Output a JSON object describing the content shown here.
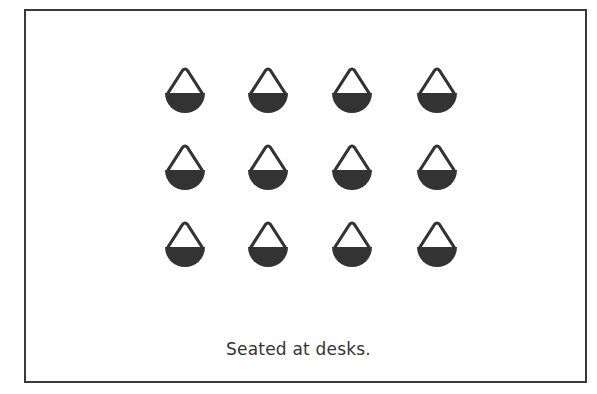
{
  "diagram": {
    "type": "seating-arrangement",
    "caption": "Seated at desks.",
    "figure_icon": "seated-person-icon",
    "rows": 3,
    "columns": 4,
    "colors": {
      "border": "#3a3a3a",
      "figure_fill": "#333333",
      "figure_outline": "#333333",
      "background": "#ffffff",
      "caption": "#333333"
    },
    "figures": [
      {
        "row": 1,
        "col": 1,
        "cx": 185,
        "top": 66
      },
      {
        "row": 1,
        "col": 2,
        "cx": 268,
        "top": 66
      },
      {
        "row": 1,
        "col": 3,
        "cx": 352,
        "top": 66
      },
      {
        "row": 1,
        "col": 4,
        "cx": 437,
        "top": 66
      },
      {
        "row": 2,
        "col": 1,
        "cx": 185,
        "top": 143
      },
      {
        "row": 2,
        "col": 2,
        "cx": 268,
        "top": 143
      },
      {
        "row": 2,
        "col": 3,
        "cx": 352,
        "top": 143
      },
      {
        "row": 2,
        "col": 4,
        "cx": 437,
        "top": 143
      },
      {
        "row": 3,
        "col": 1,
        "cx": 185,
        "top": 220
      },
      {
        "row": 3,
        "col": 2,
        "cx": 268,
        "top": 220
      },
      {
        "row": 3,
        "col": 3,
        "cx": 352,
        "top": 220
      },
      {
        "row": 3,
        "col": 4,
        "cx": 437,
        "top": 220
      }
    ]
  }
}
